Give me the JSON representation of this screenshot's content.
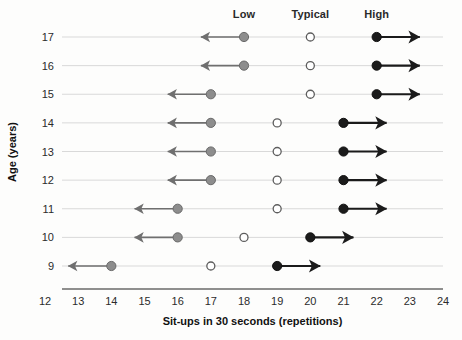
{
  "chart_data": {
    "type": "scatter",
    "title": "",
    "xlabel": "Sit-ups in 30 seconds (repetitions)",
    "ylabel": "Age (years)",
    "xlim": [
      12,
      24
    ],
    "ylim": [
      8.5,
      17.5
    ],
    "xticks": [
      12,
      13,
      14,
      15,
      16,
      17,
      18,
      19,
      20,
      21,
      22,
      23,
      24
    ],
    "yticks": [
      9,
      10,
      11,
      12,
      13,
      14,
      15,
      16,
      17
    ],
    "grid": true,
    "legend_position": "top",
    "column_headers": [
      {
        "label": "Low",
        "x": 18
      },
      {
        "label": "Typical",
        "x": 20
      },
      {
        "label": "High",
        "x": 22
      }
    ],
    "series": [
      {
        "name": "Low",
        "marker": "filled-circle-gray",
        "color": "#8a8a8a",
        "arrow": "left",
        "arrow_span": 1.3,
        "points": [
          {
            "age": 17,
            "value": 18
          },
          {
            "age": 16,
            "value": 18
          },
          {
            "age": 15,
            "value": 17
          },
          {
            "age": 14,
            "value": 17
          },
          {
            "age": 13,
            "value": 17
          },
          {
            "age": 12,
            "value": 17
          },
          {
            "age": 11,
            "value": 16
          },
          {
            "age": 10,
            "value": 16
          },
          {
            "age": 9,
            "value": 14
          }
        ]
      },
      {
        "name": "Typical",
        "marker": "open-circle",
        "color": "#ffffff",
        "arrow": "none",
        "arrow_span": 0,
        "points": [
          {
            "age": 17,
            "value": 20
          },
          {
            "age": 16,
            "value": 20
          },
          {
            "age": 15,
            "value": 20
          },
          {
            "age": 14,
            "value": 19
          },
          {
            "age": 13,
            "value": 19
          },
          {
            "age": 12,
            "value": 19
          },
          {
            "age": 11,
            "value": 19
          },
          {
            "age": 10,
            "value": 18
          },
          {
            "age": 9,
            "value": 17
          }
        ]
      },
      {
        "name": "High",
        "marker": "filled-circle-black",
        "color": "#1b1b1b",
        "arrow": "right",
        "arrow_span": 1.3,
        "points": [
          {
            "age": 17,
            "value": 22
          },
          {
            "age": 16,
            "value": 22
          },
          {
            "age": 15,
            "value": 22
          },
          {
            "age": 14,
            "value": 21
          },
          {
            "age": 13,
            "value": 21
          },
          {
            "age": 12,
            "value": 21
          },
          {
            "age": 11,
            "value": 21
          },
          {
            "age": 10,
            "value": 20
          },
          {
            "age": 9,
            "value": 19
          }
        ]
      }
    ]
  }
}
